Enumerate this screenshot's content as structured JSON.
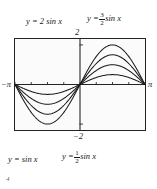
{
  "figure": {
    "corner_mark": "4"
  },
  "labels": {
    "top_left": {
      "lhs": "y = 2 sin x"
    },
    "top_right": {
      "prefix": "y =",
      "num": "3",
      "den": "2",
      "suffix": "sin x"
    },
    "bottom_left": {
      "lhs": "y = sin x"
    },
    "bottom_right": {
      "prefix": "y =",
      "num": "1",
      "den": "2",
      "suffix": "sin x"
    }
  },
  "axes": {
    "y_top_label": "2",
    "y_bottom_label": "−2",
    "x_left_label": "−π",
    "x_right_label": "π"
  },
  "chart_data": {
    "type": "line",
    "title": "",
    "xlabel": "",
    "ylabel": "",
    "xlim": [
      -3.14159265,
      3.14159265
    ],
    "ylim": [
      -2.3,
      2.3
    ],
    "grid": false,
    "legend": "inline-annotations",
    "x_ticks": [
      -3.14159265,
      -2.35619449,
      -1.57079633,
      -0.78539816,
      0,
      0.78539816,
      1.57079633,
      2.35619449,
      3.14159265
    ],
    "x_tick_labels": [
      "−π",
      "",
      "",
      "",
      "",
      "",
      "",
      "",
      "π"
    ],
    "y_ticks": [
      -2,
      2
    ],
    "y_tick_labels": [
      "−2",
      "2"
    ],
    "series": [
      {
        "name": "y = 2 sin x",
        "amplitude": 2,
        "label_position": "top-left",
        "x": [
          -3.14159265,
          -2.7488936,
          -2.35619449,
          -1.96349541,
          -1.57079633,
          -1.17809725,
          -0.78539816,
          -0.39269908,
          0,
          0.39269908,
          0.78539816,
          1.17809725,
          1.57079633,
          1.96349541,
          2.35619449,
          2.7488936,
          3.14159265
        ],
        "y": [
          0,
          -0.7654,
          -1.4142,
          -1.8478,
          -2,
          -1.8478,
          -1.4142,
          -0.7654,
          0,
          0.7654,
          1.4142,
          1.8478,
          2,
          1.8478,
          1.4142,
          0.7654,
          0
        ]
      },
      {
        "name": "y = 3/2 sin x",
        "amplitude": 1.5,
        "label_position": "top-right",
        "x": [
          -3.14159265,
          -2.7488936,
          -2.35619449,
          -1.96349541,
          -1.57079633,
          -1.17809725,
          -0.78539816,
          -0.39269908,
          0,
          0.39269908,
          0.78539816,
          1.17809725,
          1.57079633,
          1.96349541,
          2.35619449,
          2.7488936,
          3.14159265
        ],
        "y": [
          0,
          -0.574,
          -1.0607,
          -1.3858,
          -1.5,
          -1.3858,
          -1.0607,
          -0.574,
          0,
          0.574,
          1.0607,
          1.3858,
          1.5,
          1.3858,
          1.0607,
          0.574,
          0
        ]
      },
      {
        "name": "y = sin x",
        "amplitude": 1,
        "label_position": "bottom-left",
        "x": [
          -3.14159265,
          -2.7488936,
          -2.35619449,
          -1.96349541,
          -1.57079633,
          -1.17809725,
          -0.78539816,
          -0.39269908,
          0,
          0.39269908,
          0.78539816,
          1.17809725,
          1.57079633,
          1.96349541,
          2.35619449,
          2.7488936,
          3.14159265
        ],
        "y": [
          0,
          -0.3827,
          -0.7071,
          -0.9239,
          -1,
          -0.9239,
          -0.7071,
          -0.3827,
          0,
          0.3827,
          0.7071,
          0.9239,
          1,
          0.9239,
          0.7071,
          0.3827,
          0
        ]
      },
      {
        "name": "y = 1/2 sin x",
        "amplitude": 0.5,
        "label_position": "bottom-right",
        "x": [
          -3.14159265,
          -2.7488936,
          -2.35619449,
          -1.96349541,
          -1.57079633,
          -1.17809725,
          -0.78539816,
          -0.39269908,
          0,
          0.39269908,
          0.78539816,
          1.17809725,
          1.57079633,
          1.96349541,
          2.35619449,
          2.7488936,
          3.14159265
        ],
        "y": [
          0,
          -0.1913,
          -0.3536,
          -0.4619,
          -0.5,
          -0.4619,
          -0.3536,
          -0.1913,
          0,
          0.1913,
          0.3536,
          0.4619,
          0.5,
          0.4619,
          0.3536,
          0.1913,
          0
        ]
      }
    ]
  },
  "colors": {
    "curve": "#1a1a1a",
    "axis": "#232323",
    "frame": "#232323",
    "plot_background": "#fbfbfb"
  }
}
